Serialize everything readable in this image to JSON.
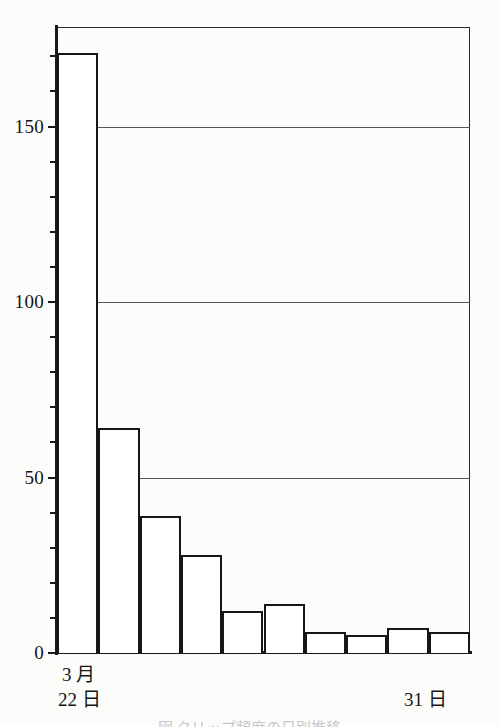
{
  "chart_data": {
    "type": "bar",
    "title": "",
    "subtitle": "",
    "xlabel": "",
    "ylabel": "",
    "categories": [
      "22",
      "23",
      "24",
      "25",
      "26",
      "27",
      "28",
      "29",
      "30",
      "31"
    ],
    "values": [
      171,
      64,
      39,
      28,
      12,
      14,
      6,
      5,
      7,
      6
    ],
    "ylim": [
      0,
      178
    ],
    "xlim": [
      0,
      10
    ],
    "y_major_ticks": [
      0,
      50,
      100,
      150
    ],
    "y_major_tick_labels": [
      "0",
      "50",
      "100",
      "150"
    ],
    "y_minor_tick_step": 10,
    "gridlines": [
      50,
      100,
      150
    ],
    "grid": true,
    "legend": null,
    "bar_fill_color": "#ffffff",
    "bar_edge_color": "#161616",
    "axis_color": "#181818",
    "grid_color": "#555555",
    "x_axis_labels": [
      {
        "line1": "3 月",
        "line2": "22 日",
        "position": "left"
      },
      {
        "line1": "31 日",
        "line2": "",
        "position": "right"
      }
    ]
  },
  "axis": {
    "y_labels": [
      "150",
      "100",
      "50",
      "0"
    ]
  },
  "x_axis": {
    "left_month": "3 月",
    "left_day": "22 日",
    "right_day": "31 日"
  },
  "caption": {
    "text": "図  クリップ頻度の日別推移"
  }
}
